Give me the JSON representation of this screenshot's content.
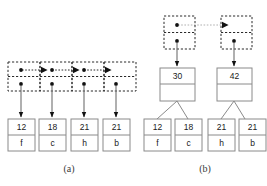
{
  "figure": {
    "panels": [
      {
        "id": "a",
        "caption": "(a)",
        "kind": "pointer-chain-over-leaf-boxes",
        "pointer_nodes": [
          {
            "index": 0,
            "top_cell": "dot",
            "bottom_cell": "dot",
            "next_link": "dotted-to-right"
          },
          {
            "index": 1,
            "top_cell": "arrow-dot",
            "bottom_cell": "dot",
            "next_link": "dotted-to-right"
          },
          {
            "index": 2,
            "top_cell": "arrow-dot",
            "bottom_cell": "dot",
            "next_link": "dotted-to-right"
          },
          {
            "index": 3,
            "top_cell": "arrow",
            "bottom_cell": "dot",
            "next_link": "none"
          }
        ],
        "leaf_boxes": [
          {
            "key": "12",
            "value": "f"
          },
          {
            "key": "18",
            "value": "c"
          },
          {
            "key": "21",
            "value": "h"
          },
          {
            "key": "21",
            "value": "b"
          }
        ]
      },
      {
        "id": "b",
        "caption": "(b)",
        "kind": "pointer-chain-over-internal-nodes-over-leaf-boxes",
        "pointer_nodes": [
          {
            "index": 0,
            "top_cell": "dot",
            "bottom_cell": "dot",
            "next_link": "dotted-to-right"
          },
          {
            "index": 1,
            "top_cell": "arrow",
            "bottom_cell": "dot",
            "next_link": "none"
          }
        ],
        "internal_nodes": [
          {
            "key": "30",
            "lower_cell": ""
          },
          {
            "key": "42",
            "lower_cell": ""
          }
        ],
        "leaf_boxes": [
          {
            "key": "12",
            "value": "f"
          },
          {
            "key": "18",
            "value": "c"
          },
          {
            "key": "21",
            "value": "h"
          },
          {
            "key": "21",
            "value": "b"
          }
        ]
      }
    ]
  },
  "colors": {
    "background": "#ffffff",
    "solid_border": "#8a8a8a",
    "dashed_border": "#2b2b2b",
    "text": "#1a1a1a",
    "caption": "#3a3a3a",
    "arrow": "#111111",
    "edge": "#8a8a8a"
  }
}
